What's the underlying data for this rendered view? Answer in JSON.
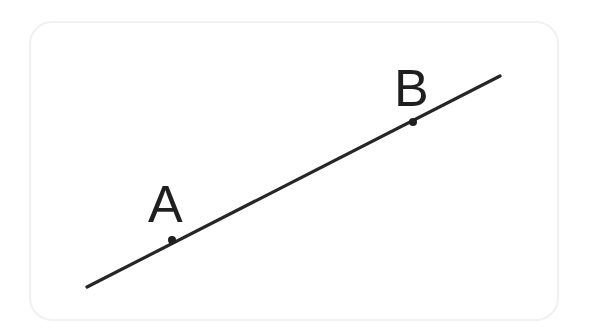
{
  "figure": {
    "kind": "geometry-line-figure",
    "canvas": {
      "width": 589,
      "height": 332,
      "background": "#ffffff"
    },
    "card": {
      "x": 30,
      "y": 22,
      "width": 528,
      "height": 298,
      "corner_radius": 22,
      "border_color": "#f1f1f2",
      "fill_color": "#ffffff"
    },
    "line": {
      "name": "line-AB",
      "color": "#262626",
      "stroke_width": 3.2,
      "x1": 87,
      "y1": 287,
      "x2": 500,
      "y2": 76
    },
    "points": [
      {
        "id": "A",
        "label": "A",
        "dot_x": 172,
        "dot_y": 240,
        "dot_radius": 4,
        "dot_color": "#1f1f1f",
        "label_x": 148,
        "label_y": 222,
        "label_font_size": 52
      },
      {
        "id": "B",
        "label": "B",
        "dot_x": 413,
        "dot_y": 122,
        "dot_radius": 4,
        "dot_color": "#1f1f1f",
        "label_x": 394,
        "label_y": 106,
        "label_font_size": 52
      }
    ]
  }
}
